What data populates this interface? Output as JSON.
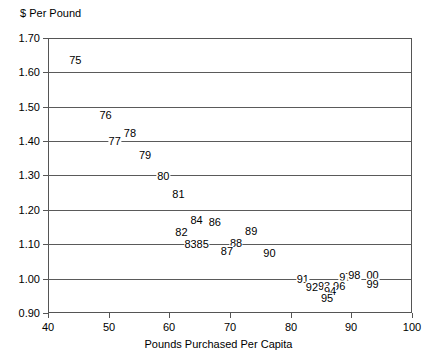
{
  "chart_data": {
    "type": "scatter",
    "title": "",
    "ylabel": "$ Per Pound",
    "xlabel": "Pounds Purchased Per Capita",
    "xlim": [
      40,
      100
    ],
    "ylim": [
      0.9,
      1.7
    ],
    "xticks": [
      "40",
      "50",
      "60",
      "70",
      "80",
      "90",
      "100"
    ],
    "yticks": [
      "1.70",
      "1.60",
      "1.50",
      "1.40",
      "1.30",
      "1.20",
      "1.10",
      "1.00",
      "0.90"
    ],
    "grid": true,
    "legend": "none",
    "point_label_style": "year-two-digit",
    "points": [
      {
        "label": "75",
        "x": 44.5,
        "y": 1.635
      },
      {
        "label": "76",
        "x": 49.5,
        "y": 1.475
      },
      {
        "label": "78",
        "x": 53.5,
        "y": 1.425
      },
      {
        "label": "77",
        "x": 51.0,
        "y": 1.4
      },
      {
        "label": "79",
        "x": 56.0,
        "y": 1.36
      },
      {
        "label": "80",
        "x": 59.0,
        "y": 1.3
      },
      {
        "label": "81",
        "x": 61.5,
        "y": 1.245
      },
      {
        "label": "84",
        "x": 64.5,
        "y": 1.17
      },
      {
        "label": "86",
        "x": 67.5,
        "y": 1.165
      },
      {
        "label": "82",
        "x": 62.0,
        "y": 1.135
      },
      {
        "label": "83",
        "x": 63.5,
        "y": 1.1
      },
      {
        "label": "85",
        "x": 65.5,
        "y": 1.1
      },
      {
        "label": "89",
        "x": 73.5,
        "y": 1.14
      },
      {
        "label": "88",
        "x": 71.0,
        "y": 1.105
      },
      {
        "label": "87",
        "x": 69.5,
        "y": 1.08
      },
      {
        "label": "90",
        "x": 76.5,
        "y": 1.075
      },
      {
        "label": "91",
        "x": 82.0,
        "y": 1.0
      },
      {
        "label": "97",
        "x": 89.0,
        "y": 1.005
      },
      {
        "label": "98",
        "x": 90.5,
        "y": 1.01
      },
      {
        "label": "00",
        "x": 93.5,
        "y": 1.01
      },
      {
        "label": "99",
        "x": 93.5,
        "y": 0.985
      },
      {
        "label": "96",
        "x": 88.0,
        "y": 0.98
      },
      {
        "label": "93",
        "x": 85.5,
        "y": 0.98
      },
      {
        "label": "92",
        "x": 83.5,
        "y": 0.975
      },
      {
        "label": "94",
        "x": 86.5,
        "y": 0.965
      },
      {
        "label": "95",
        "x": 86.0,
        "y": 0.945
      }
    ]
  }
}
